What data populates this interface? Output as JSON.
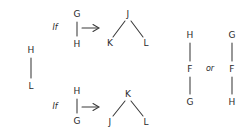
{
  "figure": {
    "background_color": "#ffffff",
    "ink_color": "#2a2a2a",
    "style": "hand-drawn graph rewriting rules"
  },
  "left_graph": {
    "name": "standalone-edge",
    "nodes": [
      {
        "id": "n-h",
        "label": "H",
        "x": 31,
        "y": 50
      },
      {
        "id": "n-l",
        "label": "L",
        "x": 31,
        "y": 86
      }
    ],
    "edges": [
      {
        "from": "n-h",
        "to": "n-l"
      }
    ]
  },
  "rule_one": {
    "name": "rule-1",
    "keyword": "If",
    "keyword_x": 55,
    "keyword_y": 28,
    "arrow": {
      "x1": 82,
      "y1": 28,
      "x2": 99,
      "y2": 28
    },
    "lhs": {
      "nodes": [
        {
          "id": "r1-g",
          "label": "G",
          "x": 77,
          "y": 14
        },
        {
          "id": "r1-h",
          "label": "H",
          "x": 77,
          "y": 44
        }
      ],
      "edges": [
        {
          "from": "r1-g",
          "to": "r1-h"
        }
      ]
    },
    "rhs": {
      "nodes": [
        {
          "id": "r1-j",
          "label": "J",
          "x": 128,
          "y": 14
        },
        {
          "id": "r1-k",
          "label": "K",
          "x": 110,
          "y": 43
        },
        {
          "id": "r1-l",
          "label": "L",
          "x": 146,
          "y": 43
        }
      ],
      "edges": [
        {
          "from": "r1-j",
          "to": "r1-k"
        },
        {
          "from": "r1-j",
          "to": "r1-l"
        }
      ]
    }
  },
  "rule_two": {
    "name": "rule-2",
    "keyword": "If",
    "keyword_x": 55,
    "keyword_y": 107,
    "arrow": {
      "x1": 82,
      "y1": 107,
      "x2": 99,
      "y2": 107
    },
    "lhs": {
      "nodes": [
        {
          "id": "r2-h",
          "label": "H",
          "x": 77,
          "y": 91
        },
        {
          "id": "r2-g",
          "label": "G",
          "x": 77,
          "y": 121
        }
      ],
      "edges": [
        {
          "from": "r2-h",
          "to": "r2-g"
        }
      ]
    },
    "rhs": {
      "nodes": [
        {
          "id": "r2-k",
          "label": "K",
          "x": 128,
          "y": 94
        },
        {
          "id": "r2-j",
          "label": "J",
          "x": 110,
          "y": 122
        },
        {
          "id": "r2-l",
          "label": "L",
          "x": 146,
          "y": 122
        }
      ],
      "edges": [
        {
          "from": "r2-k",
          "to": "r2-j"
        },
        {
          "from": "r2-k",
          "to": "r2-l"
        }
      ]
    }
  },
  "right_alternatives": {
    "name": "result-alternatives",
    "connector": "or",
    "connector_x": 210,
    "connector_y": 69,
    "option_a": {
      "nodes": [
        {
          "id": "a-h",
          "label": "H",
          "x": 190,
          "y": 35
        },
        {
          "id": "a-f",
          "label": "F",
          "x": 190,
          "y": 69
        },
        {
          "id": "a-g",
          "label": "G",
          "x": 190,
          "y": 102
        }
      ],
      "edges": [
        {
          "from": "a-h",
          "to": "a-f"
        },
        {
          "from": "a-f",
          "to": "a-g"
        }
      ]
    },
    "option_b": {
      "nodes": [
        {
          "id": "b-g",
          "label": "G",
          "x": 232,
          "y": 35
        },
        {
          "id": "b-f",
          "label": "F",
          "x": 232,
          "y": 69
        },
        {
          "id": "b-h",
          "label": "H",
          "x": 232,
          "y": 102
        }
      ],
      "edges": [
        {
          "from": "b-g",
          "to": "b-f"
        },
        {
          "from": "b-f",
          "to": "b-h"
        }
      ]
    }
  }
}
